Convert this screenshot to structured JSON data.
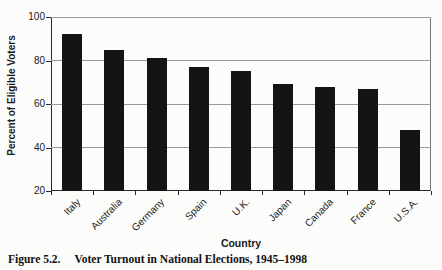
{
  "figure": {
    "caption_label": "Figure 5.2.",
    "caption_title": "Voter Turnout in National Elections, 1945–1998"
  },
  "chart_data": {
    "type": "bar",
    "title": "",
    "xlabel": "Country",
    "ylabel": "Percent of Eligible Voters",
    "categories": [
      "Italy",
      "Australia",
      "Germany",
      "Spain",
      "U.K.",
      "Japan",
      "Canada",
      "France",
      "U.S.A."
    ],
    "values": [
      92,
      85,
      81,
      77,
      75,
      69,
      68,
      67,
      48
    ],
    "ylim": [
      20,
      100
    ],
    "yticks": [
      20,
      40,
      60,
      80,
      100
    ],
    "grid": true,
    "legend": false,
    "bar_color": "#141414",
    "gridline_color": "#9a9a9a",
    "axis_color": "#2a2a2a"
  }
}
